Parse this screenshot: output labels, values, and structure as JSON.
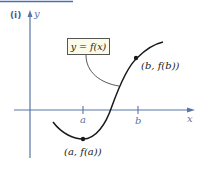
{
  "figure": {
    "part_label": "(i)",
    "equation_label": "y = f(x)",
    "axes": {
      "x_label": "x",
      "y_label": "y",
      "ticks": [
        {
          "name": "a",
          "label": "a"
        },
        {
          "name": "b",
          "label": "b"
        }
      ]
    },
    "points": [
      {
        "name": "point-a",
        "label": "(a, f(a))"
      },
      {
        "name": "point-b",
        "label": "(b, f(b))"
      }
    ],
    "colors": {
      "axis": "#5a74a8",
      "curve": "#1a1a1a",
      "box_fill": "#fbfbe9",
      "top_rule": "#4a6fb0"
    }
  }
}
